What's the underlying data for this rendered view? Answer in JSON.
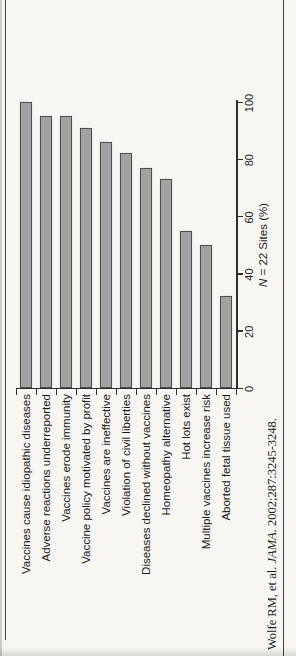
{
  "chart_data": {
    "type": "bar",
    "orientation": "horizontal",
    "rotated_on_page_deg": -90,
    "title": "",
    "categories": [
      "Vaccines cause idiopathic diseases",
      "Adverse reactions underreported",
      "Vaccines erode immunity",
      "Vaccine policy motivated by profit",
      "Vaccines are ineffective",
      "Violation of civil liberties",
      "Diseases declined without vaccines",
      "Homeopathy alternative",
      "Hot lots exist",
      "Multiple vaccines increase risk",
      "Aborted fetal tissue used"
    ],
    "values": [
      100,
      95,
      95,
      91,
      86,
      82,
      77,
      73,
      55,
      50,
      32
    ],
    "xlabel": "N = 22 Sites (%)",
    "xlabel_italic_part": "N",
    "xlabel_regular_part": " = 22 Sites (%)",
    "xticks": [
      0,
      20,
      40,
      60,
      80,
      100
    ],
    "xlim": [
      0,
      100
    ],
    "grid": false,
    "legend": false
  },
  "citation": {
    "prefix": "Wolfe RM, et al. ",
    "journal_italic": "JAMA.",
    "suffix": " 2002;287:3245-3248."
  },
  "colors": {
    "bar_fill": "#a2a2a2",
    "bar_border": "#4f4f4f",
    "axis_line": "#2e2e2e",
    "rule_line": "#3d3d3d",
    "text": "#1c1c1c",
    "background": "#f7f6f3"
  }
}
